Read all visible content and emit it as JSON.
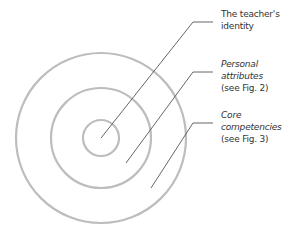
{
  "diagram": {
    "type": "concentric-circles",
    "center": [
      101,
      138
    ],
    "rings": [
      {
        "name": "inner",
        "radius": 18
      },
      {
        "name": "middle",
        "radius": 50
      },
      {
        "name": "outer",
        "radius": 85
      }
    ],
    "colors": {
      "ring": "#bdbdbd",
      "leader": "#555555",
      "text": "#333333"
    },
    "labels": [
      {
        "line1": "The teacher's",
        "line2": "identity",
        "italic_part": ""
      },
      {
        "line1": "Personal attributes",
        "line2": "(see Fig. 2)",
        "italic_part": "Personal attributes"
      },
      {
        "line1": "Core competencies",
        "line2": "(see Fig. 3)",
        "italic_part": "Core competencies"
      }
    ]
  }
}
